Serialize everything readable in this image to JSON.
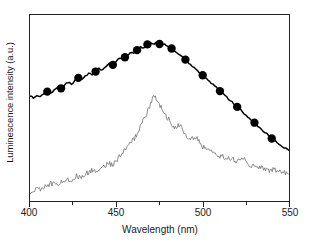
{
  "chart_data": {
    "type": "line",
    "title": "",
    "xlabel": "Wavelength (nm)",
    "ylabel": "Luminescence intensity (a.u.)",
    "xlim": [
      400,
      550
    ],
    "ylim": [
      0,
      100
    ],
    "grid": false,
    "legend_position": "none",
    "xticks_major": [
      400,
      450,
      500,
      550
    ],
    "xticks_minor": [
      425,
      475,
      525
    ],
    "xtick_labels": [
      "400",
      "450",
      "500",
      "550"
    ],
    "yticks": [],
    "ytick_labels": [],
    "colors": {
      "series_markers": "#000000",
      "series_noisy": "#6e6e6e",
      "axis": "#222222",
      "background": "#ffffff"
    },
    "series": [
      {
        "name": "Absorption / excitation profile (circles)",
        "style": "solid line with filled circle markers",
        "color": "#000000",
        "marker": "filled-circle",
        "x": [
          400,
          402,
          404,
          406,
          408,
          410,
          412,
          414,
          416,
          418,
          420,
          422,
          424,
          426,
          428,
          430,
          432,
          434,
          436,
          438,
          440,
          442,
          444,
          446,
          448,
          450,
          452,
          454,
          456,
          458,
          460,
          462,
          464,
          466,
          468,
          470,
          472,
          474,
          476,
          478,
          480,
          482,
          484,
          486,
          488,
          490,
          492,
          494,
          496,
          498,
          500,
          502,
          504,
          506,
          508,
          510,
          512,
          514,
          516,
          518,
          520,
          522,
          524,
          526,
          528,
          530,
          532,
          534,
          536,
          538,
          540,
          542,
          544,
          546,
          548,
          550
        ],
        "y": [
          56.5,
          55.4,
          56.9,
          55.8,
          57.6,
          58.8,
          58.0,
          59.8,
          61.4,
          60.6,
          62.3,
          63.8,
          63.0,
          64.6,
          66.2,
          65.4,
          67.1,
          68.6,
          67.9,
          69.6,
          71.2,
          70.5,
          72.3,
          73.9,
          73.2,
          75.1,
          76.8,
          76.1,
          78.0,
          79.8,
          79.2,
          81.1,
          82.8,
          82.4,
          84.2,
          85.0,
          84.6,
          85.4,
          84.8,
          84.1,
          83.2,
          82.0,
          80.6,
          79.2,
          77.6,
          76.0,
          74.3,
          72.7,
          71.0,
          69.3,
          67.6,
          65.9,
          64.2,
          62.5,
          60.8,
          59.1,
          57.4,
          55.7,
          54.0,
          52.3,
          50.6,
          48.9,
          47.2,
          45.5,
          43.8,
          42.1,
          40.4,
          38.7,
          37.0,
          35.3,
          33.6,
          32.2,
          30.8,
          29.4,
          28.2,
          27.0
        ],
        "marker_x": [
          410,
          418,
          428,
          438,
          448,
          455,
          462,
          468,
          475,
          482,
          490,
          500,
          510,
          520,
          530,
          540
        ],
        "marker_y": [
          58.8,
          60.6,
          66.2,
          69.6,
          73.2,
          77.3,
          81.1,
          84.2,
          84.4,
          82.0,
          76.0,
          67.6,
          59.1,
          50.6,
          42.1,
          33.6
        ]
      },
      {
        "name": "Emission spectrum (noisy)",
        "style": "thin noisy line",
        "color": "#6e6e6e",
        "marker": "none",
        "x": [
          400,
          403,
          406,
          409,
          412,
          415,
          418,
          421,
          424,
          427,
          430,
          433,
          436,
          439,
          442,
          445,
          448,
          451,
          454,
          457,
          460,
          463,
          466,
          469,
          472,
          475,
          478,
          481,
          484,
          487,
          490,
          493,
          496,
          499,
          502,
          505,
          508,
          511,
          514,
          517,
          520,
          523,
          526,
          529,
          532,
          535,
          538,
          541,
          544,
          547,
          550
        ],
        "y": [
          5.0,
          6.5,
          5.8,
          8.0,
          9.5,
          8.6,
          10.2,
          12.0,
          11.2,
          13.5,
          12.6,
          15.0,
          16.5,
          15.4,
          18.0,
          20.5,
          19.4,
          22.8,
          26.0,
          29.5,
          33.0,
          38.0,
          44.0,
          50.0,
          57.0,
          52.0,
          47.0,
          43.0,
          39.0,
          41.0,
          36.0,
          33.0,
          34.5,
          30.0,
          28.0,
          26.5,
          25.0,
          24.0,
          22.5,
          23.5,
          21.0,
          24.0,
          20.0,
          19.0,
          18.0,
          17.5,
          16.5,
          17.0,
          15.5,
          16.0,
          13.0
        ],
        "peak_wavelength": 472
      }
    ],
    "annotations": []
  },
  "axis": {
    "xlabel": "Wavelength (nm)",
    "ylabel": "Luminescence intensity (a.u.)",
    "xtick_labels": [
      "400",
      "450",
      "500",
      "550"
    ]
  }
}
